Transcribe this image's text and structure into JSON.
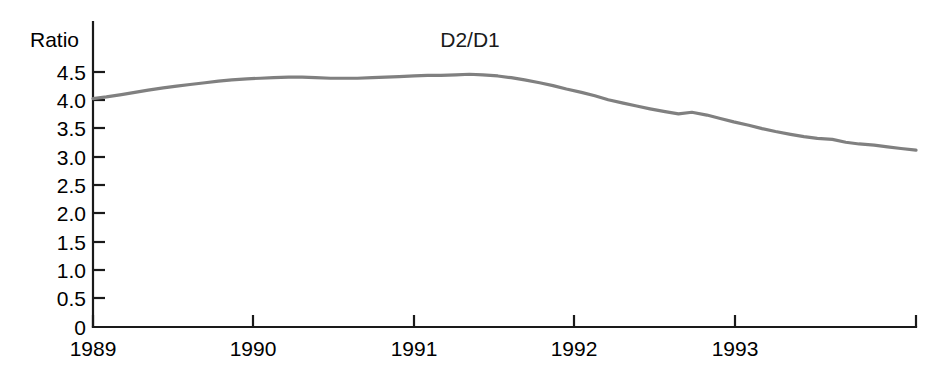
{
  "chart_data": {
    "type": "line",
    "title": "D2/D1",
    "xlabel": "",
    "ylabel": "Ratio",
    "ylim": [
      0,
      4.75
    ],
    "xlim": [
      1989.0,
      1993.92
    ],
    "grid": false,
    "legend": "none",
    "ytick_labels": [
      "0",
      "0.5",
      "1.0",
      "1.5",
      "2.0",
      "2.5",
      "3.0",
      "3.5",
      "4.0",
      "4.5"
    ],
    "ytick_values": [
      0,
      0.5,
      1.0,
      1.5,
      2.0,
      2.5,
      3.0,
      3.5,
      4.0,
      4.5
    ],
    "xtick_labels": [
      "1989",
      "1990",
      "1991",
      "1992",
      "1993"
    ],
    "xtick_values": [
      1989,
      1990,
      1991,
      1992,
      1993
    ],
    "line_color": "#808080",
    "series": [
      {
        "name": "D2/D1",
        "x": [
          1989.0,
          1989.08,
          1989.17,
          1989.25,
          1989.33,
          1989.42,
          1989.5,
          1989.58,
          1989.67,
          1989.75,
          1989.83,
          1989.92,
          1990.0,
          1990.08,
          1990.17,
          1990.25,
          1990.33,
          1990.42,
          1990.5,
          1990.58,
          1990.67,
          1990.75,
          1990.83,
          1990.92,
          1991.0,
          1991.08,
          1991.17,
          1991.25,
          1991.33,
          1991.42,
          1991.5,
          1991.58,
          1991.67,
          1991.75,
          1991.83,
          1991.92,
          1992.0,
          1992.08,
          1992.17,
          1992.25,
          1992.33,
          1992.42,
          1992.5,
          1992.58,
          1992.67,
          1992.75,
          1992.83,
          1992.92,
          1993.0,
          1993.08,
          1993.17,
          1993.25,
          1993.33,
          1993.42,
          1993.5,
          1993.58,
          1993.67,
          1993.75,
          1993.83,
          1993.92
        ],
        "values": [
          4.03,
          4.06,
          4.1,
          4.14,
          4.18,
          4.22,
          4.25,
          4.28,
          4.31,
          4.34,
          4.36,
          4.38,
          4.39,
          4.4,
          4.41,
          4.41,
          4.4,
          4.39,
          4.39,
          4.39,
          4.4,
          4.41,
          4.42,
          4.43,
          4.44,
          4.44,
          4.45,
          4.46,
          4.45,
          4.43,
          4.4,
          4.36,
          4.31,
          4.26,
          4.2,
          4.14,
          4.08,
          4.01,
          3.95,
          3.9,
          3.85,
          3.8,
          3.76,
          3.79,
          3.74,
          3.68,
          3.62,
          3.56,
          3.5,
          3.45,
          3.4,
          3.36,
          3.33,
          3.31,
          3.26,
          3.23,
          3.21,
          3.18,
          3.15,
          3.12
        ]
      }
    ],
    "annotations": {
      "start_value": 4.03,
      "peak_value": 4.46,
      "peak_year": 1991.25,
      "end_value": 3.12,
      "end_year": 1993.92
    }
  },
  "axes": {
    "y_axis_name": "y-axis",
    "x_axis_name": "x-axis"
  }
}
